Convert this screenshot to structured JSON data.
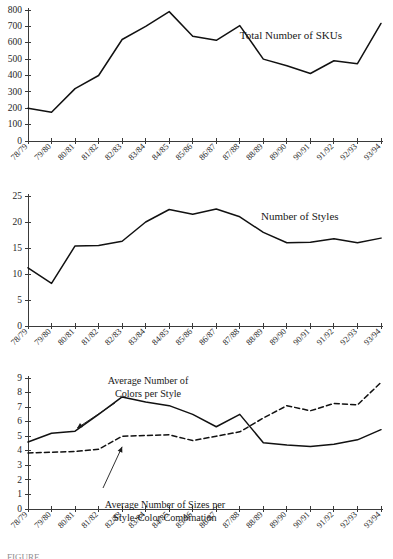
{
  "figure": {
    "caption": "FIGURE",
    "background": "#ffffff",
    "line_color": "#111111",
    "axis_color": "#3a3a3a"
  },
  "categories": [
    "78/79",
    "79/80",
    "80/81",
    "81/82",
    "82/83",
    "83/84",
    "84/85",
    "85/86",
    "86/87",
    "87/88",
    "88/89",
    "89/90",
    "90/91",
    "91/92",
    "92/93",
    "93/94"
  ],
  "chart_data": [
    {
      "type": "line",
      "title": "",
      "xlabel": "",
      "ylabel": "",
      "ylim": [
        0,
        800
      ],
      "yticks": [
        0,
        100,
        200,
        300,
        400,
        500,
        600,
        700,
        800
      ],
      "grid": false,
      "legend_position": "inline-right",
      "categories": [
        "78/79",
        "79/80",
        "80/81",
        "81/82",
        "82/83",
        "83/84",
        "84/85",
        "85/86",
        "86/87",
        "87/88",
        "88/89",
        "89/90",
        "90/91",
        "91/92",
        "92/93",
        "93/94"
      ],
      "series": [
        {
          "name": "Total Number of SKUs",
          "style": "solid",
          "values": [
            200,
            175,
            320,
            400,
            620,
            700,
            790,
            640,
            615,
            705,
            500,
            460,
            412,
            490,
            472,
            718
          ]
        }
      ],
      "annotations": [
        {
          "text": "Total Number of SKUs",
          "x_frac": 0.6,
          "y_value": 620
        }
      ]
    },
    {
      "type": "line",
      "title": "",
      "xlabel": "",
      "ylabel": "",
      "ylim": [
        0,
        25
      ],
      "yticks": [
        0,
        5,
        10,
        15,
        20,
        25
      ],
      "grid": false,
      "legend_position": "inline-right",
      "categories": [
        "78/79",
        "79/80",
        "80/81",
        "81/82",
        "82/83",
        "83/84",
        "84/85",
        "85/86",
        "86/87",
        "87/88",
        "88/89",
        "89/90",
        "90/91",
        "91/92",
        "92/93",
        "93/94"
      ],
      "series": [
        {
          "name": "Number of Styles",
          "style": "solid",
          "values": [
            11.2,
            8.2,
            15.4,
            15.5,
            16.3,
            20.0,
            22.4,
            21.5,
            22.5,
            21.0,
            18.0,
            16.0,
            16.1,
            16.8,
            16.0,
            16.9
          ]
        }
      ],
      "annotations": [
        {
          "text": "Number of Styles",
          "x_frac": 0.66,
          "y_value": 20.3
        }
      ]
    },
    {
      "type": "line",
      "title": "",
      "xlabel": "",
      "ylabel": "",
      "ylim": [
        0,
        9
      ],
      "yticks": [
        0,
        1,
        2,
        3,
        4,
        5,
        6,
        7,
        8,
        9
      ],
      "grid": false,
      "legend_position": "inline-annotated",
      "categories": [
        "78/79",
        "79/80",
        "80/81",
        "81/82",
        "82/83",
        "83/84",
        "84/85",
        "85/86",
        "86/87",
        "87/88",
        "88/89",
        "89/90",
        "90/91",
        "91/92",
        "92/93",
        "93/94"
      ],
      "series": [
        {
          "name": "Average Number of Colors per Style",
          "style": "solid",
          "values": [
            4.6,
            5.2,
            5.35,
            6.5,
            7.7,
            7.35,
            7.1,
            6.5,
            5.65,
            6.5,
            4.55,
            4.4,
            4.3,
            4.45,
            4.75,
            5.45
          ]
        },
        {
          "name": "Average Number of Sizes per Style-Color Combination",
          "style": "dashed",
          "values": [
            3.85,
            3.9,
            3.95,
            4.1,
            5.0,
            5.05,
            5.1,
            4.7,
            5.0,
            5.3,
            6.25,
            7.1,
            6.75,
            7.25,
            7.15,
            8.7
          ]
        }
      ],
      "annotations": [
        {
          "text_line1": "Average Number of",
          "text_line2": "Colors per Style",
          "target_index": 2,
          "target_value": 5.35
        },
        {
          "text_line1": "Average Number of Sizes per",
          "text_line2": "Style-Color Combination",
          "target_index": 4,
          "target_value": 4.55
        }
      ]
    }
  ]
}
